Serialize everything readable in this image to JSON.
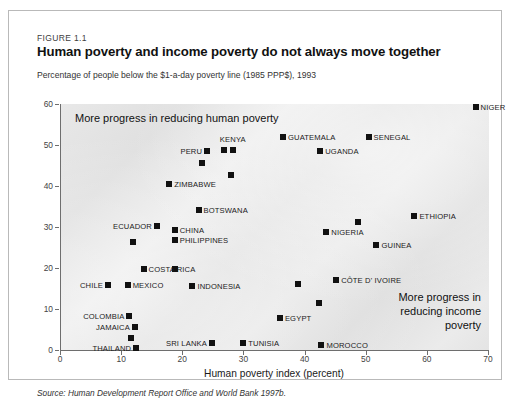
{
  "figure": {
    "number": "FIGURE 1.1",
    "title": "Human poverty and income poverty do not always move together",
    "subtitle": "Percentage of people below the $1-a-day poverty line (1985 PPP$), 1993",
    "source": "Source: Human Development Report Office and World Bank 1997b."
  },
  "annotations": {
    "left": "More progress in reducing human poverty",
    "right": "More progress in reducing income poverty"
  },
  "chart_data": {
    "type": "scatter",
    "title": "Human poverty and income poverty do not always move together",
    "subtitle": "Percentage of people below the $1-a-day poverty line (1985 PPP$), 1993",
    "xlabel": "Human poverty index (percent)",
    "ylabel": "",
    "xlim": [
      0,
      70
    ],
    "ylim": [
      0,
      60
    ],
    "xticks": [
      0,
      10,
      20,
      30,
      40,
      50,
      60,
      70
    ],
    "yticks": [
      0,
      10,
      20,
      30,
      40,
      50,
      60
    ],
    "grid": false,
    "legend": "none",
    "marker": "square",
    "marker_color": "#111111",
    "plot_background": "#e6e6e6",
    "points": [
      {
        "label": "NIGER",
        "x": 67.8,
        "y": 59.3,
        "lx": "l"
      },
      {
        "label": "SENEGAL",
        "x": 50.3,
        "y": 52.0,
        "lx": "l"
      },
      {
        "label": "GUATEMALA",
        "x": 36.3,
        "y": 52.0,
        "lx": "l"
      },
      {
        "label": "UGANDA",
        "x": 42.4,
        "y": 48.5,
        "lx": "l"
      },
      {
        "label": "KENYA",
        "x": 28.1,
        "y": 48.8,
        "lx": "c"
      },
      {
        "label": "",
        "x": 26.6,
        "y": 48.8,
        "lx": "n"
      },
      {
        "label": "PERU",
        "x": 23.9,
        "y": 48.5,
        "lx": "r"
      },
      {
        "label": "",
        "x": 23.0,
        "y": 45.6,
        "lx": "n"
      },
      {
        "label": "",
        "x": 27.8,
        "y": 42.7,
        "lx": "n"
      },
      {
        "label": "ZIMBABWE",
        "x": 17.7,
        "y": 40.5,
        "lx": "l"
      },
      {
        "label": "BOTSWANA",
        "x": 22.5,
        "y": 34.1,
        "lx": "l"
      },
      {
        "label": "ETHIOPIA",
        "x": 57.8,
        "y": 32.7,
        "lx": "l"
      },
      {
        "label": "",
        "x": 48.6,
        "y": 31.2,
        "lx": "n"
      },
      {
        "label": "ECUADOR",
        "x": 15.7,
        "y": 30.2,
        "lx": "r"
      },
      {
        "label": "CHINA",
        "x": 18.6,
        "y": 29.3,
        "lx": "l"
      },
      {
        "label": "PHILIPPINES",
        "x": 18.6,
        "y": 26.8,
        "lx": "l"
      },
      {
        "label": "NIGERIA",
        "x": 43.4,
        "y": 28.8,
        "lx": "l"
      },
      {
        "label": "",
        "x": 11.8,
        "y": 26.3,
        "lx": "n"
      },
      {
        "label": "GUINEA",
        "x": 51.6,
        "y": 25.6,
        "lx": "l"
      },
      {
        "label": "COSTA RICA",
        "x": 13.5,
        "y": 19.8,
        "lx": "l"
      },
      {
        "label": "",
        "x": 18.6,
        "y": 19.8,
        "lx": "n"
      },
      {
        "label": "CÔTE D' IVOIRE",
        "x": 45.0,
        "y": 17.1,
        "lx": "l"
      },
      {
        "label": "CHILE",
        "x": 7.7,
        "y": 15.9,
        "lx": "r"
      },
      {
        "label": "MEXICO",
        "x": 10.9,
        "y": 15.9,
        "lx": "l"
      },
      {
        "label": "INDONESIA",
        "x": 21.5,
        "y": 15.6,
        "lx": "l"
      },
      {
        "label": "",
        "x": 38.8,
        "y": 16.1,
        "lx": "n"
      },
      {
        "label": "",
        "x": 42.2,
        "y": 11.5,
        "lx": "n"
      },
      {
        "label": "COLOMBIA",
        "x": 11.2,
        "y": 8.3,
        "lx": "r"
      },
      {
        "label": "JAMAICA",
        "x": 12.1,
        "y": 5.6,
        "lx": "r"
      },
      {
        "label": "EGYPT",
        "x": 35.8,
        "y": 7.8,
        "lx": "l"
      },
      {
        "label": "",
        "x": 11.4,
        "y": 2.9,
        "lx": "n"
      },
      {
        "label": "SRI LANKA",
        "x": 24.7,
        "y": 1.7,
        "lx": "r"
      },
      {
        "label": "TUNISIA",
        "x": 29.8,
        "y": 1.7,
        "lx": "l"
      },
      {
        "label": "THAILAND",
        "x": 12.3,
        "y": 0.5,
        "lx": "r"
      },
      {
        "label": "MOROCCO",
        "x": 42.6,
        "y": 1.2,
        "lx": "l"
      }
    ]
  }
}
